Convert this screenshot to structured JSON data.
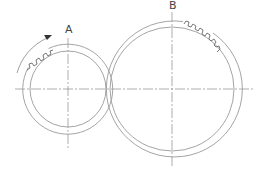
{
  "diagram": {
    "gears": [
      {
        "label": "A",
        "cx": 68,
        "cy": 89,
        "outer_r": 45,
        "inner_r": 38,
        "teeth_start_deg": 200,
        "teeth_end_deg": 245
      },
      {
        "label": "B",
        "cx": 172,
        "cy": 89,
        "outer_r": 68,
        "inner_r": 62,
        "teeth_start_deg": 280,
        "teeth_end_deg": 325
      }
    ],
    "rotation_arrow": {
      "direction": "clockwise",
      "around": "A"
    },
    "colors": {
      "lines": "#9a9a9a",
      "teeth": "#6a6a6a",
      "text": "#444444"
    }
  }
}
